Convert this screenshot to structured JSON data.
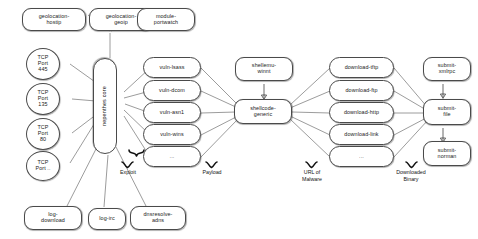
{
  "diagram": {
    "type": "flow-diagram",
    "core": {
      "id": "nepenthes-core",
      "label": "nepenthes core"
    },
    "modules_top": [
      {
        "id": "geolocation-hostip",
        "label": "geolocation-\nhostip"
      },
      {
        "id": "geolocation-geoip",
        "label": "geolocation-\ngeoip"
      },
      {
        "id": "module-portwatch",
        "label": "module-\nportwatch"
      }
    ],
    "ports": [
      {
        "id": "tcp-port-445",
        "label": "TCP\nPort\n445"
      },
      {
        "id": "tcp-port-135",
        "label": "TCP\nPort\n135"
      },
      {
        "id": "tcp-port-80",
        "label": "TCP\nPort\n80"
      },
      {
        "id": "tcp-port-etc",
        "label": "TCP\nPort .."
      }
    ],
    "modules_bottom": [
      {
        "id": "log-download",
        "label": "log-\ndownload"
      },
      {
        "id": "log-irc",
        "label": "log-irc"
      },
      {
        "id": "dnsresolve-adns",
        "label": "dnsresolve-\nadns"
      }
    ],
    "vulns": [
      {
        "id": "vuln-lsass",
        "label": "vuln-lsass"
      },
      {
        "id": "vuln-dcom",
        "label": "vuln-dcom"
      },
      {
        "id": "vuln-asn1",
        "label": "vuln-asn1"
      },
      {
        "id": "vuln-wins",
        "label": "vuln-wins"
      },
      {
        "id": "vuln-more",
        "label": "..."
      }
    ],
    "shellcode": [
      {
        "id": "shellemu-winnt",
        "label": "shellemu-\nwinnt"
      },
      {
        "id": "shellcode-generic",
        "label": "shellcode-\ngeneric"
      }
    ],
    "downloads": [
      {
        "id": "download-tftp",
        "label": "download-tftp"
      },
      {
        "id": "download-ftp",
        "label": "download-ftp"
      },
      {
        "id": "download-http",
        "label": "download-http"
      },
      {
        "id": "download-link",
        "label": "download-link"
      },
      {
        "id": "download-more",
        "label": "..."
      }
    ],
    "submits": [
      {
        "id": "submit-xmlrpc",
        "label": "submit-\nxmlrpc"
      },
      {
        "id": "submit-file",
        "label": "submit-\nfile"
      },
      {
        "id": "submit-norman",
        "label": "submit-\nnorman"
      }
    ],
    "brace_labels": [
      {
        "id": "exploit",
        "label": "Exploit"
      },
      {
        "id": "payload",
        "label": "Payload"
      },
      {
        "id": "url-of-malware",
        "label": "URL of\nMalware"
      },
      {
        "id": "downloaded-binary",
        "label": "Downloaded\nBinary"
      }
    ],
    "colors": {
      "node_border": "#4a4a4a",
      "node_fill": "#ffffff",
      "edge": "#4a4a4a",
      "text": "#1a1a1a",
      "brace": "#111111"
    }
  }
}
